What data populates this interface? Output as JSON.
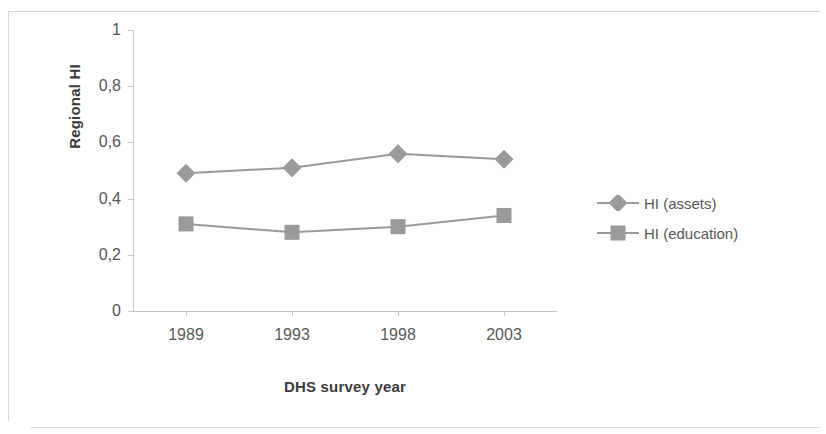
{
  "chart_data": {
    "type": "line",
    "title": "",
    "xlabel": "DHS survey year",
    "ylabel": "Regional HI",
    "categories": [
      "1989",
      "1993",
      "1998",
      "2003"
    ],
    "ylim": [
      0,
      1
    ],
    "ytick_labels": [
      "0",
      "0,2",
      "0,4",
      "0,6",
      "0,8",
      "1"
    ],
    "ytick_values": [
      0,
      0.2,
      0.4,
      0.6,
      0.8,
      1
    ],
    "grid": false,
    "legend_position": "right",
    "series": [
      {
        "name": "HI (assets)",
        "marker": "diamond",
        "color": "#9a9a9a",
        "values": [
          0.49,
          0.51,
          0.56,
          0.54
        ]
      },
      {
        "name": "HI (education)",
        "marker": "square",
        "color": "#9a9a9a",
        "values": [
          0.31,
          0.28,
          0.3,
          0.34
        ]
      }
    ]
  },
  "axis": {
    "line_color": "#c8c8c8"
  }
}
